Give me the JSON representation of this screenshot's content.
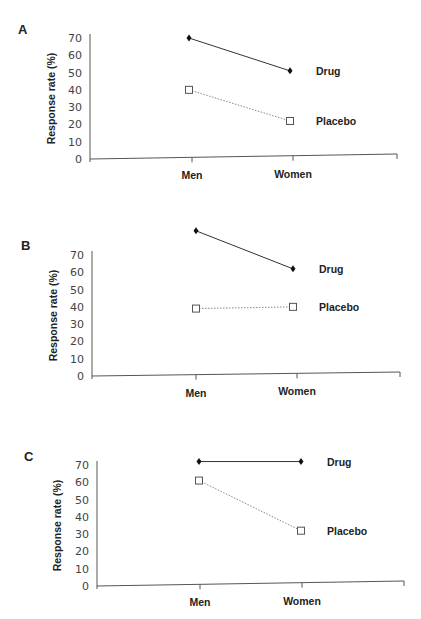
{
  "figure": {
    "panels": [
      "A",
      "B",
      "C"
    ]
  },
  "chart_data": [
    {
      "panel": "A",
      "type": "line",
      "categories": [
        "Men",
        "Women"
      ],
      "series": [
        {
          "name": "Drug",
          "values": [
            70,
            51
          ],
          "marker": "filled-diamond",
          "line": "solid"
        },
        {
          "name": "Placebo",
          "values": [
            40,
            22
          ],
          "marker": "open-square",
          "line": "dotted"
        }
      ],
      "ylabel": "Response rate (%)",
      "xlabel": "",
      "yticks": [
        "0",
        "10",
        "20",
        "30",
        "40",
        "50",
        "60",
        "70"
      ],
      "ylim": [
        0,
        70
      ],
      "grid": false,
      "legend": "inline-right"
    },
    {
      "panel": "B",
      "type": "line",
      "categories": [
        "Men",
        "Women"
      ],
      "series": [
        {
          "name": "Drug",
          "values": [
            84,
            62
          ],
          "marker": "filled-diamond",
          "line": "solid"
        },
        {
          "name": "Placebo",
          "values": [
            39,
            40
          ],
          "marker": "open-square",
          "line": "dotted"
        }
      ],
      "ylabel": "Response rate (%)",
      "xlabel": "",
      "yticks": [
        "0",
        "10",
        "20",
        "30",
        "40",
        "50",
        "60",
        "70"
      ],
      "ylim": [
        0,
        70
      ],
      "grid": false,
      "legend": "inline-right"
    },
    {
      "panel": "C",
      "type": "line",
      "categories": [
        "Men",
        "Women"
      ],
      "series": [
        {
          "name": "Drug",
          "values": [
            72,
            72
          ],
          "marker": "filled-diamond",
          "line": "solid"
        },
        {
          "name": "Placebo",
          "values": [
            61,
            32
          ],
          "marker": "open-square",
          "line": "dotted"
        }
      ],
      "ylabel": "Response rate (%)",
      "xlabel": "",
      "yticks": [
        "0",
        "10",
        "20",
        "30",
        "40",
        "50",
        "60",
        "70"
      ],
      "ylim": [
        0,
        70
      ],
      "grid": false,
      "legend": "inline-right"
    }
  ],
  "layout": [
    {
      "letter_x": 18,
      "letter_y": 34,
      "y_axis_x": 90,
      "y0": 159,
      "y70": 38,
      "x_end": 397,
      "x_end_y": 154,
      "cat_x": [
        192,
        293
      ],
      "point_x": [
        189,
        290
      ],
      "label_x": [
        140,
        330,
        330
      ],
      "axis_title_x": 55
    },
    {
      "letter_x": 21,
      "letter_y": 250,
      "y_axis_x": 92,
      "y0": 376,
      "y70": 255,
      "x_end": 400,
      "x_end_y": 372,
      "cat_x": [
        196,
        297
      ],
      "point_x": [
        196,
        293
      ],
      "label_x": [
        140,
        316,
        316
      ],
      "axis_title_x": 57
    },
    {
      "letter_x": 24,
      "letter_y": 461,
      "y_axis_x": 97,
      "y0": 586,
      "y70": 465,
      "x_end": 404,
      "x_end_y": 581,
      "cat_x": [
        200,
        302
      ],
      "point_x": [
        199,
        301
      ],
      "label_x": [
        140,
        319,
        319
      ],
      "axis_title_x": 61
    }
  ],
  "colors": {
    "drug": "#111111",
    "placebo_line": "#888888",
    "axis": "#555555"
  }
}
